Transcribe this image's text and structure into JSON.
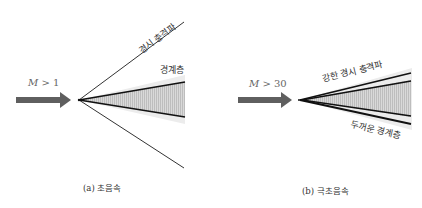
{
  "panels": [
    {
      "id": "a",
      "mach_label": "M > 1",
      "mach_var": "M",
      "mach_rel": " > 1",
      "shock_label": "경시 충격파",
      "boundary_label": "경계층",
      "caption": "(a) 초음속"
    },
    {
      "id": "b",
      "mach_label": "M > 30",
      "mach_var": "M",
      "mach_rel": " > 30",
      "shock_label": "강한 경시 충격파",
      "boundary_label": "두꺼운 경계층",
      "caption": "(b) 극초음속"
    }
  ],
  "colors": {
    "arrow": "#5f5f5f",
    "lines": "#222222",
    "shade_outer": "#e6e6e6",
    "shade_inner": "#c8c8c8"
  }
}
